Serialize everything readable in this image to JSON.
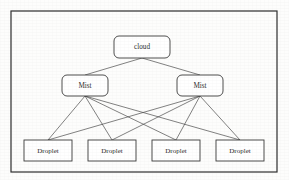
{
  "diagram": {
    "type": "hierarchy-tree",
    "frame": {
      "name": "outer-border",
      "x": 11,
      "y": 11,
      "width": 266,
      "height": 161
    },
    "colors": {
      "background": "#fdfdfc",
      "node_fill": "#ffffff",
      "node_stroke": "#3a3a3a",
      "edge_stroke": "#4a4a4a",
      "frame_stroke": "#2e2e2e",
      "text": "#2b2b2b"
    },
    "levels": [
      {
        "level_name": "cloud-tier",
        "nodes": [
          {
            "id": "cloud",
            "label": "cloud",
            "shape": "rounded-rect",
            "x": 114,
            "y": 36,
            "width": 56,
            "height": 22,
            "radius": 5,
            "font_size": 7.2
          }
        ]
      },
      {
        "level_name": "mist-tier",
        "nodes": [
          {
            "id": "mist-left",
            "label": "Mist",
            "shape": "rounded-rect",
            "x": 62,
            "y": 75,
            "width": 46,
            "height": 21,
            "radius": 5,
            "font_size": 7.2
          },
          {
            "id": "mist-right",
            "label": "Mist",
            "shape": "rounded-rect",
            "x": 177,
            "y": 75,
            "width": 46,
            "height": 21,
            "radius": 5,
            "font_size": 7.2
          }
        ]
      },
      {
        "level_name": "droplet-tier",
        "nodes": [
          {
            "id": "droplet-1",
            "label": "Droplet",
            "shape": "rect",
            "x": 24,
            "y": 140,
            "width": 48,
            "height": 21,
            "radius": 0,
            "font_size": 7.0
          },
          {
            "id": "droplet-2",
            "label": "Droplet",
            "shape": "rect",
            "x": 88,
            "y": 140,
            "width": 48,
            "height": 21,
            "radius": 0,
            "font_size": 7.0
          },
          {
            "id": "droplet-3",
            "label": "Droplet",
            "shape": "rect",
            "x": 152,
            "y": 140,
            "width": 48,
            "height": 21,
            "radius": 0,
            "font_size": 7.0
          },
          {
            "id": "droplet-4",
            "label": "Droplet",
            "shape": "rect",
            "x": 216,
            "y": 140,
            "width": 48,
            "height": 21,
            "radius": 0,
            "font_size": 7.0
          }
        ]
      }
    ],
    "edges": [
      {
        "id": "e-cloud-mistL",
        "from": "cloud",
        "to": "mist-left",
        "x1": 142,
        "y1": 58,
        "x2": 85,
        "y2": 75
      },
      {
        "id": "e-cloud-mistR",
        "from": "cloud",
        "to": "mist-right",
        "x1": 142,
        "y1": 58,
        "x2": 200,
        "y2": 75
      },
      {
        "id": "e-mistL-d1",
        "from": "mist-left",
        "to": "droplet-1",
        "x1": 85,
        "y1": 96,
        "x2": 48,
        "y2": 140
      },
      {
        "id": "e-mistL-d2",
        "from": "mist-left",
        "to": "droplet-2",
        "x1": 85,
        "y1": 96,
        "x2": 112,
        "y2": 140
      },
      {
        "id": "e-mistL-d3",
        "from": "mist-left",
        "to": "droplet-3",
        "x1": 85,
        "y1": 96,
        "x2": 176,
        "y2": 140
      },
      {
        "id": "e-mistL-d4",
        "from": "mist-left",
        "to": "droplet-4",
        "x1": 85,
        "y1": 96,
        "x2": 240,
        "y2": 140
      },
      {
        "id": "e-mistR-d1",
        "from": "mist-right",
        "to": "droplet-1",
        "x1": 200,
        "y1": 96,
        "x2": 48,
        "y2": 140
      },
      {
        "id": "e-mistR-d2",
        "from": "mist-right",
        "to": "droplet-2",
        "x1": 200,
        "y1": 96,
        "x2": 112,
        "y2": 140
      },
      {
        "id": "e-mistR-d3",
        "from": "mist-right",
        "to": "droplet-3",
        "x1": 200,
        "y1": 96,
        "x2": 176,
        "y2": 140
      },
      {
        "id": "e-mistR-d4",
        "from": "mist-right",
        "to": "droplet-4",
        "x1": 200,
        "y1": 96,
        "x2": 240,
        "y2": 140
      }
    ]
  }
}
